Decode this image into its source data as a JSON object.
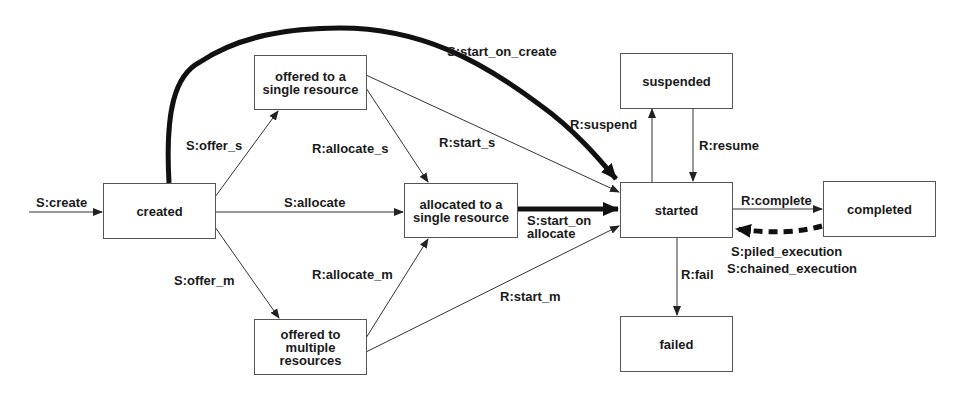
{
  "diagram": {
    "type": "state-transition",
    "states": {
      "created": "created",
      "offered_single": "offered to a single resource",
      "offered_single_l1": "offered to a",
      "offered_single_l2": "single resource",
      "offered_multiple_l1": "offered to",
      "offered_multiple_l2": "multiple",
      "offered_multiple_l3": "resources",
      "allocated_l1": "allocated to a",
      "allocated_l2": "single resource",
      "started": "started",
      "suspended": "suspended",
      "completed": "completed",
      "failed": "failed"
    },
    "transitions": {
      "create": "S:create",
      "offer_s": "S:offer_s",
      "offer_m": "S:offer_m",
      "allocate": "S:allocate",
      "allocate_s": "R:allocate_s",
      "allocate_m": "R:allocate_m",
      "start_s": "R:start_s",
      "start_m": "R:start_m",
      "start_on_create": "S:start_on_create",
      "start_on_allocate_l1": "S:start_on",
      "start_on_allocate_l2": "allocate",
      "suspend": "R:suspend",
      "resume": "R:resume",
      "complete": "R:complete",
      "fail": "R:fail",
      "piled_execution": "S:piled_execution",
      "chained_execution": "S:chained_execution"
    },
    "colors": {
      "line": "#333333",
      "box_border": "#555555",
      "text": "#1a1a1a"
    }
  }
}
